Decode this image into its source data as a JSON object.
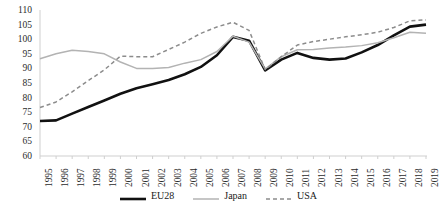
{
  "chart_data": {
    "type": "line",
    "title": "",
    "subtitle": "",
    "xlabel": "",
    "ylabel": "",
    "grid": false,
    "legend_position": "bottom",
    "xlim": [
      1995,
      2019
    ],
    "ylim": [
      60,
      110
    ],
    "y_ticks": [
      110,
      105,
      100,
      95,
      90,
      85,
      80,
      75,
      70,
      65,
      60
    ],
    "x": [
      1995,
      1996,
      1997,
      1998,
      1999,
      2000,
      2001,
      2002,
      2003,
      2004,
      2005,
      2006,
      2007,
      2008,
      2009,
      2010,
      2011,
      2012,
      2013,
      2014,
      2015,
      2016,
      2017,
      2018,
      2019
    ],
    "categories": [
      "1995",
      "1996",
      "1997",
      "1998",
      "1999",
      "2000",
      "2001",
      "2002",
      "2003",
      "2004",
      "2005",
      "2006",
      "2007",
      "2008",
      "2009",
      "2010",
      "2011",
      "2012",
      "2013",
      "2014",
      "2015",
      "2016",
      "2017",
      "2018",
      "2019"
    ],
    "series": [
      {
        "name": "EU28",
        "color": "#111111",
        "style": "solid",
        "width": 2.6,
        "values": [
          72.0,
          72.2,
          74.5,
          76.8,
          79.0,
          81.3,
          83.2,
          84.6,
          86.0,
          88.0,
          90.5,
          94.5,
          100.8,
          99.5,
          89.3,
          93.0,
          95.3,
          93.6,
          93.0,
          93.4,
          95.5,
          98.0,
          101.3,
          104.3,
          105.0
        ]
      },
      {
        "name": "Japan",
        "color": "#b3b3b3",
        "style": "solid",
        "width": 1.5,
        "values": [
          93.3,
          95.0,
          96.2,
          95.8,
          95.0,
          92.2,
          90.0,
          90.0,
          90.3,
          91.8,
          93.0,
          95.8,
          101.0,
          99.0,
          89.8,
          94.0,
          96.4,
          96.5,
          97.0,
          97.3,
          97.8,
          98.8,
          100.5,
          102.4,
          102.0
        ]
      },
      {
        "name": "USA",
        "color": "#8c8c8c",
        "style": "dashed",
        "width": 1.5,
        "values": [
          76.6,
          78.5,
          82.0,
          85.8,
          89.5,
          94.2,
          94.0,
          94.0,
          96.5,
          99.0,
          102.0,
          104.2,
          105.8,
          103.0,
          89.6,
          94.0,
          98.0,
          99.2,
          100.0,
          100.8,
          101.5,
          102.4,
          104.0,
          106.3,
          106.6
        ]
      }
    ]
  },
  "legend": {
    "entries": [
      {
        "label": "EU28"
      },
      {
        "label": "Japan"
      },
      {
        "label": "USA"
      }
    ]
  }
}
